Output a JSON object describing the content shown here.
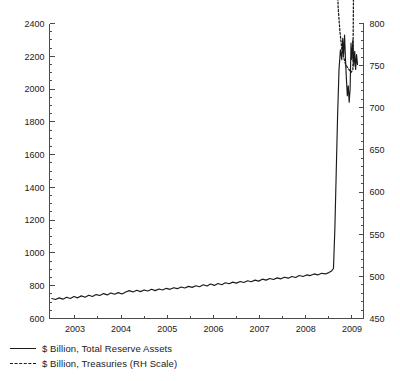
{
  "chart_data": {
    "type": "line",
    "title": "",
    "xlabel": "",
    "ylabel": "",
    "grid": false,
    "legend_position": "bottom-left",
    "x": [
      2002.5,
      2003,
      2004,
      2005,
      2006,
      2007,
      2008,
      2009,
      2009.2
    ],
    "xlim": [
      2002.45,
      2009.25
    ],
    "xticks": [
      "2003",
      "2004",
      "2005",
      "2006",
      "2007",
      "2008",
      "2009"
    ],
    "xtick_values": [
      2003,
      2004,
      2005,
      2006,
      2007,
      2008,
      2009
    ],
    "left_axis": {
      "label": "$ Billion, Total Reserve Assets",
      "ylim": [
        600,
        2400
      ],
      "ticks": [
        600,
        800,
        1000,
        1200,
        1400,
        1600,
        1800,
        2000,
        2200,
        2400
      ],
      "minor_tick_step": 50
    },
    "right_axis": {
      "label": "$ Billion, Treasuries (RH Scale)",
      "ylim": [
        450,
        800
      ],
      "ticks": [
        450,
        500,
        550,
        600,
        650,
        700,
        750,
        800
      ],
      "minor_tick_step": 10
    },
    "series": [
      {
        "name": "$ Billion, Total Reserve Assets",
        "axis": "left",
        "style": "solid",
        "color": "#1a1a1a",
        "points": [
          [
            2002.5,
            722
          ],
          [
            2002.58,
            716
          ],
          [
            2002.66,
            726
          ],
          [
            2002.74,
            718
          ],
          [
            2002.82,
            730
          ],
          [
            2002.9,
            722
          ],
          [
            2002.98,
            734
          ],
          [
            2003.06,
            726
          ],
          [
            2003.14,
            738
          ],
          [
            2003.22,
            730
          ],
          [
            2003.3,
            742
          ],
          [
            2003.38,
            734
          ],
          [
            2003.46,
            746
          ],
          [
            2003.54,
            740
          ],
          [
            2003.62,
            752
          ],
          [
            2003.7,
            744
          ],
          [
            2003.78,
            756
          ],
          [
            2003.86,
            748
          ],
          [
            2003.94,
            758
          ],
          [
            2004.02,
            750
          ],
          [
            2004.1,
            762
          ],
          [
            2004.18,
            770
          ],
          [
            2004.26,
            762
          ],
          [
            2004.34,
            772
          ],
          [
            2004.42,
            764
          ],
          [
            2004.5,
            774
          ],
          [
            2004.58,
            768
          ],
          [
            2004.66,
            778
          ],
          [
            2004.74,
            770
          ],
          [
            2004.82,
            780
          ],
          [
            2004.9,
            774
          ],
          [
            2004.98,
            784
          ],
          [
            2005.06,
            778
          ],
          [
            2005.14,
            788
          ],
          [
            2005.22,
            782
          ],
          [
            2005.3,
            792
          ],
          [
            2005.38,
            786
          ],
          [
            2005.46,
            796
          ],
          [
            2005.54,
            790
          ],
          [
            2005.62,
            800
          ],
          [
            2005.7,
            794
          ],
          [
            2005.78,
            806
          ],
          [
            2005.86,
            798
          ],
          [
            2005.94,
            810
          ],
          [
            2006.02,
            802
          ],
          [
            2006.1,
            814
          ],
          [
            2006.18,
            806
          ],
          [
            2006.26,
            818
          ],
          [
            2006.34,
            812
          ],
          [
            2006.42,
            822
          ],
          [
            2006.5,
            816
          ],
          [
            2006.58,
            826
          ],
          [
            2006.66,
            820
          ],
          [
            2006.74,
            830
          ],
          [
            2006.82,
            824
          ],
          [
            2006.9,
            834
          ],
          [
            2006.98,
            828
          ],
          [
            2007.06,
            840
          ],
          [
            2007.14,
            834
          ],
          [
            2007.22,
            844
          ],
          [
            2007.3,
            838
          ],
          [
            2007.38,
            848
          ],
          [
            2007.46,
            842
          ],
          [
            2007.54,
            852
          ],
          [
            2007.62,
            846
          ],
          [
            2007.7,
            856
          ],
          [
            2007.78,
            850
          ],
          [
            2007.86,
            862
          ],
          [
            2007.94,
            856
          ],
          [
            2008.02,
            866
          ],
          [
            2008.1,
            862
          ],
          [
            2008.18,
            872
          ],
          [
            2008.26,
            866
          ],
          [
            2008.34,
            876
          ],
          [
            2008.42,
            872
          ],
          [
            2008.5,
            880
          ],
          [
            2008.56,
            890
          ],
          [
            2008.6,
            905
          ],
          [
            2008.63,
            1150
          ],
          [
            2008.66,
            1500
          ],
          [
            2008.69,
            1850
          ],
          [
            2008.72,
            2120
          ],
          [
            2008.75,
            2240
          ],
          [
            2008.78,
            2180
          ],
          [
            2008.8,
            2310
          ],
          [
            2008.82,
            2210
          ],
          [
            2008.84,
            2330
          ],
          [
            2008.86,
            2180
          ],
          [
            2008.88,
            2060
          ],
          [
            2008.9,
            1960
          ],
          [
            2008.92,
            2020
          ],
          [
            2008.94,
            1920
          ],
          [
            2008.96,
            2000
          ],
          [
            2008.98,
            2280
          ],
          [
            2009.0,
            2180
          ],
          [
            2009.02,
            2300
          ],
          [
            2009.04,
            2140
          ],
          [
            2009.06,
            2230
          ],
          [
            2009.08,
            2120
          ],
          [
            2009.1,
            2210
          ],
          [
            2009.12,
            2150
          ]
        ]
      },
      {
        "name": "$ Billion, Treasuries (RH Scale)",
        "axis": "right",
        "style": "dashed",
        "color": "#1a1a1a",
        "points": [
          [
            2002.5,
            1520
          ],
          [
            2002.58,
            1535
          ],
          [
            2002.66,
            1552
          ],
          [
            2002.74,
            1568
          ],
          [
            2002.82,
            1585
          ],
          [
            2002.9,
            1600
          ],
          [
            2002.98,
            1612
          ],
          [
            2003.06,
            1620
          ],
          [
            2003.14,
            1628
          ],
          [
            2003.22,
            1618
          ],
          [
            2003.3,
            1625
          ],
          [
            2003.38,
            1632
          ],
          [
            2003.46,
            1640
          ],
          [
            2003.54,
            1635
          ],
          [
            2003.62,
            1645
          ],
          [
            2003.7,
            1655
          ],
          [
            2003.78,
            1668
          ],
          [
            2003.86,
            1680
          ],
          [
            2003.94,
            1690
          ],
          [
            2004.02,
            1700
          ],
          [
            2004.1,
            1695
          ],
          [
            2004.18,
            1705
          ],
          [
            2004.26,
            1712
          ],
          [
            2004.34,
            1720
          ],
          [
            2004.42,
            1735
          ],
          [
            2004.5,
            1750
          ],
          [
            2004.58,
            1765
          ],
          [
            2004.66,
            1780
          ],
          [
            2004.74,
            1795
          ],
          [
            2004.82,
            1808
          ],
          [
            2004.9,
            1800
          ],
          [
            2004.98,
            1812
          ],
          [
            2005.06,
            1825
          ],
          [
            2005.14,
            1840
          ],
          [
            2005.22,
            1855
          ],
          [
            2005.3,
            1870
          ],
          [
            2005.38,
            1885
          ],
          [
            2005.46,
            1900
          ],
          [
            2005.54,
            1915
          ],
          [
            2005.62,
            1930
          ],
          [
            2005.7,
            1945
          ],
          [
            2005.78,
            1960
          ],
          [
            2005.86,
            1968
          ],
          [
            2005.94,
            1962
          ],
          [
            2006.02,
            1955
          ],
          [
            2006.1,
            1962
          ],
          [
            2006.18,
            1968
          ],
          [
            2006.26,
            1975
          ],
          [
            2006.34,
            1990
          ],
          [
            2006.42,
            2010
          ],
          [
            2006.5,
            2025
          ],
          [
            2006.58,
            2020
          ],
          [
            2006.66,
            2035
          ],
          [
            2006.74,
            2060
          ],
          [
            2006.82,
            2085
          ],
          [
            2006.9,
            2110
          ],
          [
            2006.98,
            2130
          ],
          [
            2007.06,
            2150
          ],
          [
            2007.14,
            2170
          ],
          [
            2007.22,
            2165
          ],
          [
            2007.3,
            2185
          ],
          [
            2007.38,
            2200
          ],
          [
            2007.46,
            2220
          ],
          [
            2007.54,
            2245
          ],
          [
            2007.62,
            2270
          ],
          [
            2007.7,
            2290
          ],
          [
            2007.78,
            2310
          ],
          [
            2007.86,
            2320
          ],
          [
            2007.94,
            2315
          ],
          [
            2008.0,
            2325
          ],
          [
            2008.06,
            2318
          ],
          [
            2008.1,
            2280
          ],
          [
            2008.14,
            2270
          ],
          [
            2008.18,
            2265
          ],
          [
            2008.22,
            2180
          ],
          [
            2008.26,
            2060
          ],
          [
            2008.3,
            1940
          ],
          [
            2008.34,
            1830
          ],
          [
            2008.38,
            1800
          ],
          [
            2008.42,
            1700
          ],
          [
            2008.46,
            1560
          ],
          [
            2008.5,
            1420
          ],
          [
            2008.54,
            1280
          ],
          [
            2008.58,
            1150
          ],
          [
            2008.62,
            1020
          ],
          [
            2008.66,
            900
          ],
          [
            2008.7,
            820
          ],
          [
            2008.74,
            790
          ],
          [
            2008.78,
            770
          ],
          [
            2008.82,
            760
          ],
          [
            2008.86,
            752
          ],
          [
            2008.9,
            748
          ],
          [
            2008.94,
            745
          ],
          [
            2008.98,
            742
          ],
          [
            2009.02,
            745
          ],
          [
            2009.04,
            880
          ],
          [
            2009.06,
            1050
          ],
          [
            2009.08,
            1220
          ],
          [
            2009.1,
            1390
          ],
          [
            2009.12,
            1560
          ],
          [
            2009.14,
            1640
          ]
        ]
      }
    ]
  },
  "legend": {
    "items": [
      {
        "style": "solid",
        "label": "$ Billion, Total Reserve Assets"
      },
      {
        "style": "dashed",
        "label": "$ Billion, Treasuries (RH Scale)"
      }
    ]
  },
  "colors": {
    "line": "#1a1a1a",
    "axis": "#4a4a4a",
    "background": "#ffffff"
  }
}
